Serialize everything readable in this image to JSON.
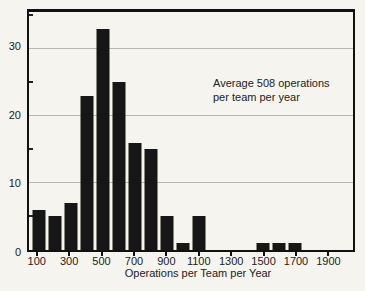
{
  "figure": {
    "xlabel": "Operations per Team per Year",
    "annotation_line1": "Average 508 operations",
    "annotation_line2": "per team per year"
  },
  "chart_data": {
    "type": "bar",
    "title": "",
    "xlabel": "Operations per Team per Year",
    "ylabel": "",
    "annotation": "Average 508 operations per team per year",
    "categories": [
      100,
      200,
      300,
      400,
      500,
      600,
      700,
      800,
      900,
      1000,
      1100,
      1200,
      1300,
      1400,
      1500,
      1600,
      1700,
      1800,
      1900
    ],
    "values": [
      6,
      5,
      7,
      23,
      33,
      25,
      16,
      15,
      5,
      1,
      5,
      0,
      0,
      0,
      1,
      1,
      1,
      0,
      0
    ],
    "x_tick_labels": [
      100,
      300,
      500,
      700,
      900,
      1100,
      1300,
      1500,
      1700,
      1900
    ],
    "y_tick_labels": [
      0,
      10,
      20,
      30
    ],
    "y_minor_ticks": [
      5,
      15,
      25,
      35
    ],
    "grid_values": [
      10,
      20,
      30
    ],
    "ylim": [
      0,
      35.5
    ],
    "x_domain_ops": [
      40,
      2064
    ],
    "bar_width_ops": 80,
    "grid": "horizontal",
    "legend_position": "none"
  },
  "colors": {
    "bar": "#161616",
    "frame": "#111111",
    "gridline": "#b8b6b0",
    "background": "#f6f4ef",
    "text": "#222222"
  }
}
